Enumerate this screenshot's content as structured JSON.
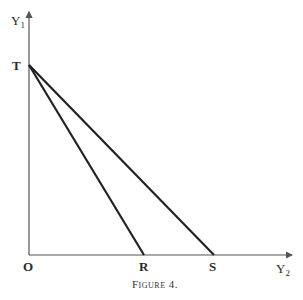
{
  "figure": {
    "caption": "Figure 4.",
    "axes": {
      "y_label": "Y",
      "y_subscript": "1",
      "x_label": "Y",
      "x_subscript": "2"
    },
    "points": {
      "origin": "O",
      "T": "T",
      "R": "R",
      "S": "S"
    },
    "lines": [
      {
        "name": "T-R",
        "from": "T",
        "to": "R"
      },
      {
        "name": "T-S",
        "from": "T",
        "to": "S"
      }
    ]
  }
}
